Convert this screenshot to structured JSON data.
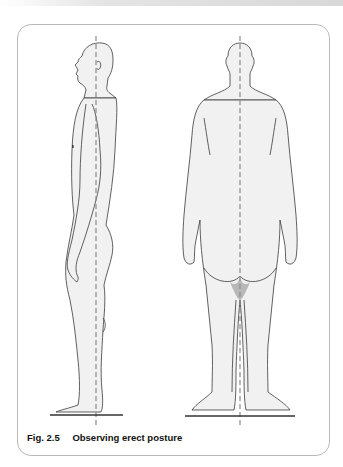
{
  "figure": {
    "number": "Fig. 2.5",
    "caption": "Observing erect posture",
    "panels": [
      {
        "id": "lateral-view",
        "description": "Side (lateral) view of standing male figure with vertical plumb line"
      },
      {
        "id": "posterior-view",
        "description": "Back (posterior) view of standing male figure with vertical plumb line"
      }
    ]
  },
  "colors": {
    "outline": "#3a3a3a",
    "fill": "#f1f1f1",
    "shadow": "#b8b8b8",
    "plumb_line": "#8a8a8a",
    "frame_border": "#b9b9b9"
  }
}
